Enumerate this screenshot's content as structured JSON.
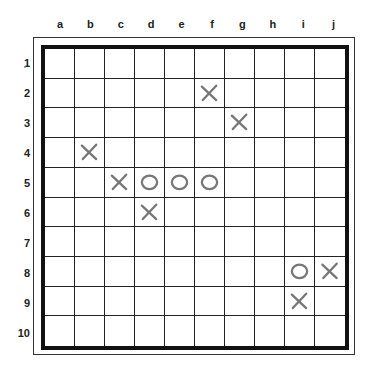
{
  "columns": [
    "a",
    "b",
    "c",
    "d",
    "e",
    "f",
    "g",
    "h",
    "i",
    "j"
  ],
  "rows": [
    "1",
    "2",
    "3",
    "4",
    "5",
    "6",
    "7",
    "8",
    "9",
    "10"
  ],
  "mark_color": "#777777",
  "pieces": [
    {
      "col": "f",
      "row": 2,
      "symbol": "X"
    },
    {
      "col": "g",
      "row": 3,
      "symbol": "X"
    },
    {
      "col": "b",
      "row": 4,
      "symbol": "X"
    },
    {
      "col": "c",
      "row": 5,
      "symbol": "X"
    },
    {
      "col": "d",
      "row": 5,
      "symbol": "O"
    },
    {
      "col": "e",
      "row": 5,
      "symbol": "O"
    },
    {
      "col": "f",
      "row": 5,
      "symbol": "O"
    },
    {
      "col": "d",
      "row": 6,
      "symbol": "X"
    },
    {
      "col": "i",
      "row": 8,
      "symbol": "O"
    },
    {
      "col": "j",
      "row": 8,
      "symbol": "X"
    },
    {
      "col": "i",
      "row": 9,
      "symbol": "X"
    }
  ]
}
